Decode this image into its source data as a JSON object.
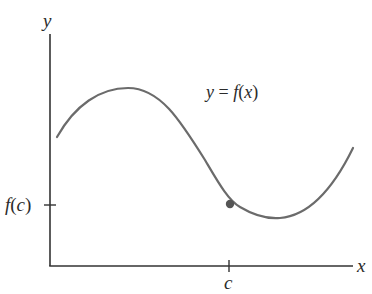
{
  "diagram": {
    "type": "function-graph",
    "axes": {
      "y_label": "y",
      "x_label": "x",
      "color": "#333333"
    },
    "curve": {
      "label_lhs": "y",
      "label_eq": " = ",
      "label_f": "f",
      "label_open": "(",
      "label_var": "x",
      "label_close": ")",
      "color": "#6b6b6b",
      "shape": "smooth curve rising to a local maximum, falling through point (c, f(c)), reaching a local minimum, then rising again"
    },
    "point": {
      "x_tick_label": "c",
      "y_tick_label_f": "f",
      "y_tick_label_open": "(",
      "y_tick_label_var": "c",
      "y_tick_label_close": ")",
      "color": "#555555"
    }
  }
}
